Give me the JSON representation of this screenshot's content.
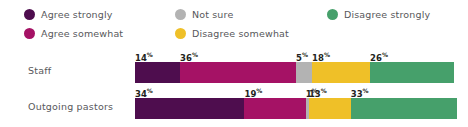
{
  "legend": {
    "columns": [
      [
        {
          "label": "Agree strongly",
          "color": "#4E0D4E",
          "icon": "legend-dot-icon"
        },
        {
          "label": "Agree somewhat",
          "color": "#A51265",
          "icon": "legend-dot-icon"
        }
      ],
      [
        {
          "label": "Not sure",
          "color": "#B3B3B3",
          "icon": "legend-dot-icon"
        },
        {
          "label": "Disagree somewhat",
          "color": "#EFC028",
          "icon": "legend-dot-icon"
        }
      ],
      [
        {
          "label": "Disagree strongly",
          "color": "#46A06B",
          "icon": "legend-dot-icon"
        }
      ]
    ]
  },
  "chart_data": {
    "type": "bar",
    "orientation": "horizontal",
    "stacked": true,
    "normalized_percent": true,
    "title": "",
    "subtitle": "",
    "xlabel": "",
    "ylabel": "",
    "xlim": [
      0,
      100
    ],
    "grid": false,
    "legend_position": "top",
    "categories": [
      "Staff",
      "Outgoing pastors"
    ],
    "series": [
      {
        "name": "Agree strongly",
        "color": "#4E0D4E",
        "values": [
          14,
          34
        ]
      },
      {
        "name": "Agree somewhat",
        "color": "#A51265",
        "values": [
          36,
          19
        ]
      },
      {
        "name": "Not sure",
        "color": "#B3B3B3",
        "values": [
          5,
          1
        ]
      },
      {
        "name": "Disagree somewhat",
        "color": "#EFC028",
        "values": [
          18,
          13
        ]
      },
      {
        "name": "Disagree strongly",
        "color": "#46A06B",
        "values": [
          26,
          33
        ]
      }
    ],
    "value_suffix": "%",
    "rows": [
      {
        "category": "Staff",
        "segments": [
          {
            "name": "Agree strongly",
            "value": 14,
            "display": "14",
            "suffix": "%",
            "color": "#4E0D4E"
          },
          {
            "name": "Agree somewhat",
            "value": 36,
            "display": "36",
            "suffix": "%",
            "color": "#A51265"
          },
          {
            "name": "Not sure",
            "value": 5,
            "display": "5",
            "suffix": "%",
            "color": "#B3B3B3"
          },
          {
            "name": "Disagree somewhat",
            "value": 18,
            "display": "18",
            "suffix": "%",
            "color": "#EFC028"
          },
          {
            "name": "Disagree strongly",
            "value": 26,
            "display": "26",
            "suffix": "%",
            "color": "#46A06B"
          }
        ]
      },
      {
        "category": "Outgoing pastors",
        "segments": [
          {
            "name": "Agree strongly",
            "value": 34,
            "display": "34",
            "suffix": "%",
            "color": "#4E0D4E"
          },
          {
            "name": "Agree somewhat",
            "value": 19,
            "display": "19",
            "suffix": "%",
            "color": "#A51265"
          },
          {
            "name": "Not sure",
            "value": 1,
            "display": "1",
            "suffix": "%",
            "color": "#B3B3B3"
          },
          {
            "name": "Disagree somewhat",
            "value": 13,
            "display": "13",
            "suffix": "%",
            "color": "#EFC028"
          },
          {
            "name": "Disagree strongly",
            "value": 33,
            "display": "33",
            "suffix": "%",
            "color": "#46A06B"
          }
        ]
      }
    ]
  },
  "colors": {
    "agree_strongly": "#4E0D4E",
    "agree_somewhat": "#A51265",
    "not_sure": "#B3B3B3",
    "disagree_somewhat": "#EFC028",
    "disagree_strongly": "#46A06B",
    "text": "#58585b",
    "value_text": "#231f20",
    "background": "#ffffff"
  }
}
